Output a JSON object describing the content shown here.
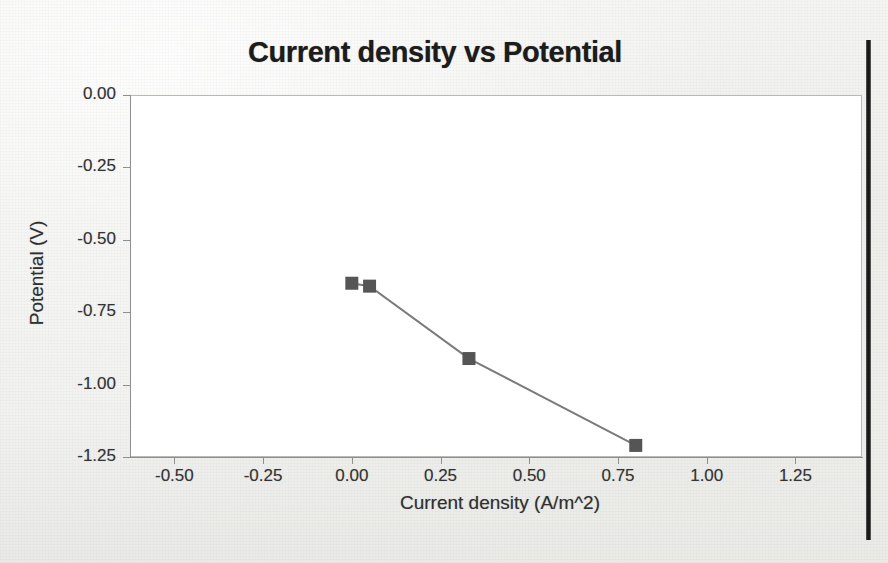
{
  "chart_data": {
    "type": "line",
    "title": "Current density vs Potential",
    "xlabel": "Current density (A/m^2)",
    "ylabel": "Potential (V)",
    "xlim": [
      -0.625,
      1.4375
    ],
    "ylim": [
      -1.25,
      0.0
    ],
    "grid": false,
    "legend": "none",
    "marker": "square",
    "marker_color": "#555555",
    "line_color": "#7a7a7a",
    "x_ticks": [
      "-0.50",
      "-0.25",
      "0.00",
      "0.25",
      "0.50",
      "0.75",
      "1.00",
      "1.25"
    ],
    "x_tick_values": [
      -0.5,
      -0.25,
      0.0,
      0.25,
      0.5,
      0.75,
      1.0,
      1.25
    ],
    "y_ticks": [
      "0.00",
      "-0.25",
      "-0.50",
      "-0.75",
      "-1.00",
      "-1.25"
    ],
    "y_tick_values": [
      0.0,
      -0.25,
      -0.5,
      -0.75,
      -1.0,
      -1.25
    ],
    "series": [
      {
        "name": "Potential",
        "x": [
          0.0,
          0.05,
          0.33,
          0.8
        ],
        "y": [
          -0.65,
          -0.66,
          -0.91,
          -1.21
        ]
      }
    ]
  },
  "page": {
    "background_color": "#f1f1ef",
    "edge_color": "#1b1b1b"
  }
}
